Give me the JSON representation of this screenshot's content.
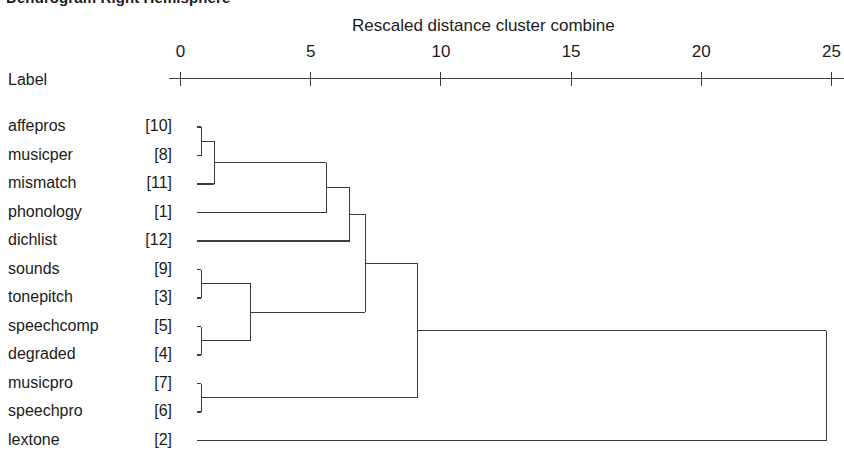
{
  "title": "Dendrogram Right Hemisphere",
  "label_column_header": "Label",
  "axis": {
    "title": "Rescaled distance cluster combine",
    "ticks": [
      {
        "value": 0,
        "label": "0"
      },
      {
        "value": 5,
        "label": "5"
      },
      {
        "value": 10,
        "label": "10"
      },
      {
        "value": 15,
        "label": "15"
      },
      {
        "value": 20,
        "label": "20"
      },
      {
        "value": 25,
        "label": "25"
      }
    ]
  },
  "colors": {
    "line": "#3c3c3c",
    "text": "#1b1b1b",
    "background": "#ffffff"
  },
  "chart_data": {
    "type": "dendrogram",
    "title": "Dendrogram Right Hemisphere",
    "xlabel": "Rescaled distance cluster combine",
    "ylabel": "Label",
    "xlim": [
      0,
      25
    ],
    "xticks": [
      0,
      5,
      10,
      15,
      20,
      25
    ],
    "grid": false,
    "legend": null,
    "leaves": [
      {
        "name": "affepros",
        "index": 10,
        "row": 0
      },
      {
        "name": "musicper",
        "index": 8,
        "row": 1
      },
      {
        "name": "mismatch",
        "index": 11,
        "row": 2
      },
      {
        "name": "phonology",
        "index": 1,
        "row": 3
      },
      {
        "name": "dichlist",
        "index": 12,
        "row": 4
      },
      {
        "name": "sounds",
        "index": 9,
        "row": 5
      },
      {
        "name": "tonepitch",
        "index": 3,
        "row": 6
      },
      {
        "name": "speechcomp",
        "index": 5,
        "row": 7
      },
      {
        "name": "degraded",
        "index": 4,
        "row": 8
      },
      {
        "name": "musicpro",
        "index": 7,
        "row": 9
      },
      {
        "name": "speechpro",
        "index": 6,
        "row": 10
      },
      {
        "name": "lextone",
        "index": 2,
        "row": 11
      }
    ],
    "merges": [
      {
        "id": "m1",
        "left": "affepros",
        "right": "musicper",
        "distance": 0.8
      },
      {
        "id": "m2",
        "left": "m1",
        "right": "mismatch",
        "distance": 1.3
      },
      {
        "id": "m3",
        "left": "m2",
        "right": "phonology",
        "distance": 5.6
      },
      {
        "id": "m4",
        "left": "m3",
        "right": "dichlist",
        "distance": 6.5
      },
      {
        "id": "m5",
        "left": "sounds",
        "right": "tonepitch",
        "distance": 0.8
      },
      {
        "id": "m6",
        "left": "speechcomp",
        "right": "degraded",
        "distance": 0.8
      },
      {
        "id": "m7",
        "left": "m5",
        "right": "m6",
        "distance": 2.7
      },
      {
        "id": "m8",
        "left": "m4",
        "right": "m7",
        "distance": 7.1
      },
      {
        "id": "m9",
        "left": "musicpro",
        "right": "speechpro",
        "distance": 0.8
      },
      {
        "id": "m10",
        "left": "m8",
        "right": "m9",
        "distance": 9.1
      },
      {
        "id": "m11",
        "left": "m10",
        "right": "lextone",
        "distance": 24.8
      }
    ]
  }
}
